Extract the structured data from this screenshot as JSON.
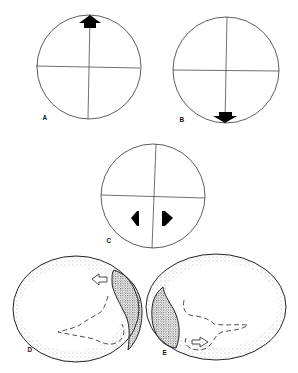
{
  "figure": {
    "panels": [
      {
        "id": "A",
        "label": "A",
        "type": "circle-quadrant",
        "arrow": "up",
        "arrow_position": "top"
      },
      {
        "id": "B",
        "label": "B",
        "type": "circle-quadrant",
        "arrow": "down",
        "arrow_position": "bottom"
      },
      {
        "id": "C",
        "label": "C",
        "type": "circle-quadrant",
        "arrows": [
          "left",
          "right"
        ],
        "arrow_position": "lower-center"
      },
      {
        "id": "D",
        "label": "D",
        "type": "egg",
        "shaded_cap": "right",
        "open_arrow": "left",
        "dashed_embryo": true
      },
      {
        "id": "E",
        "label": "E",
        "type": "egg",
        "shaded_cap": "left",
        "open_arrow": "right",
        "dashed_embryo": true
      }
    ],
    "colors": {
      "line": "#333333",
      "fill": "#000000",
      "stipple": "#555555",
      "background": "#ffffff"
    }
  }
}
